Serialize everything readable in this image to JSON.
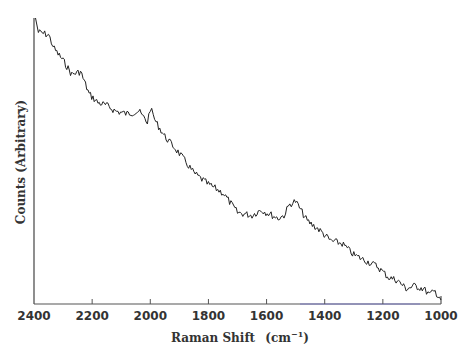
{
  "chart_data": {
    "type": "line",
    "title": "",
    "xlabel": "Raman Shift (cm⁻¹)",
    "ylabel": "Counts (Arbitrary)",
    "xlim": [
      2400,
      1000
    ],
    "x_reversed": true,
    "x_ticks": [
      2400,
      2200,
      2000,
      1800,
      1600,
      1400,
      1200,
      1000
    ],
    "y_ticks": [],
    "grid": false,
    "legend": null,
    "series": [
      {
        "name": "Raman spectrum",
        "color": "#222222",
        "x": [
          2395,
          2385,
          2350,
          2330,
          2300,
          2270,
          2240,
          2210,
          2180,
          2150,
          2120,
          2080,
          2040,
          2010,
          2000,
          1980,
          1950,
          1900,
          1850,
          1800,
          1750,
          1700,
          1650,
          1620,
          1580,
          1560,
          1540,
          1520,
          1500,
          1460,
          1420,
          1380,
          1340,
          1300,
          1260,
          1220,
          1180,
          1150,
          1120,
          1090,
          1060,
          1040,
          1020,
          1005
        ],
        "y_relative": [
          1.0,
          0.95,
          0.94,
          0.89,
          0.85,
          0.8,
          0.81,
          0.73,
          0.7,
          0.69,
          0.67,
          0.66,
          0.67,
          0.63,
          0.68,
          0.63,
          0.58,
          0.52,
          0.45,
          0.41,
          0.38,
          0.31,
          0.3,
          0.32,
          0.3,
          0.29,
          0.3,
          0.34,
          0.35,
          0.28,
          0.25,
          0.21,
          0.2,
          0.16,
          0.14,
          0.12,
          0.08,
          0.07,
          0.04,
          0.05,
          0.04,
          0.02,
          0.03,
          0.01
        ]
      }
    ]
  },
  "axes": {
    "x_ticks": [
      "2400",
      "2200",
      "2000",
      "1800",
      "1600",
      "1400",
      "1200",
      "1000"
    ],
    "xlabel_main": "Raman Shift",
    "xlabel_unit_open": "(cm",
    "xlabel_unit_sup": "−1",
    "xlabel_unit_close": ")",
    "ylabel": "Counts (Arbitrary)"
  }
}
